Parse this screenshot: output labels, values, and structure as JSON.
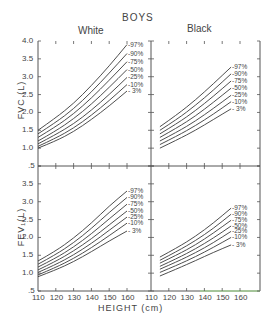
{
  "title": "BOYS",
  "groups": [
    "White",
    "Black"
  ],
  "xlabel": "HEIGHT (cm)",
  "colors": {
    "line": "#3a3a3a",
    "axis": "#555555",
    "accent_top": "#b070c0",
    "accent_green": "#9fe08a"
  },
  "chart_data": [
    {
      "type": "line",
      "title": "BOYS — White — FVC",
      "xlabel": "HEIGHT (cm)",
      "ylabel": "FVC (L)",
      "xlim": [
        110,
        170
      ],
      "ylim": [
        0.5,
        4.0
      ],
      "xticks": [
        110,
        120,
        130,
        140,
        150,
        160
      ],
      "yticks": [
        0.5,
        1.0,
        1.5,
        2.0,
        2.5,
        3.0,
        3.5,
        4.0
      ],
      "x": [
        110,
        120,
        130,
        140,
        150,
        160
      ],
      "series": [
        {
          "name": "97%",
          "values": [
            1.5,
            1.85,
            2.25,
            2.75,
            3.3,
            3.9
          ]
        },
        {
          "name": "90%",
          "values": [
            1.4,
            1.72,
            2.1,
            2.57,
            3.1,
            3.65
          ]
        },
        {
          "name": "75%",
          "values": [
            1.3,
            1.6,
            1.96,
            2.4,
            2.9,
            3.42
          ]
        },
        {
          "name": "50%",
          "values": [
            1.2,
            1.48,
            1.82,
            2.23,
            2.7,
            3.2
          ]
        },
        {
          "name": "25%",
          "values": [
            1.12,
            1.38,
            1.68,
            2.06,
            2.5,
            2.98
          ]
        },
        {
          "name": "10%",
          "values": [
            1.05,
            1.28,
            1.56,
            1.92,
            2.33,
            2.78
          ]
        },
        {
          "name": "3%",
          "values": [
            1.0,
            1.2,
            1.46,
            1.8,
            2.18,
            2.6
          ]
        }
      ]
    },
    {
      "type": "line",
      "title": "BOYS — Black — FVC",
      "xlabel": "HEIGHT (cm)",
      "ylabel": "FVC (L)",
      "xlim": [
        110,
        170
      ],
      "ylim": [
        0.5,
        4.0
      ],
      "xticks": [
        110,
        120,
        130,
        140,
        150,
        160
      ],
      "x": [
        115,
        125,
        135,
        145,
        155
      ],
      "series": [
        {
          "name": "97%",
          "values": [
            1.6,
            1.95,
            2.35,
            2.8,
            3.27
          ]
        },
        {
          "name": "90%",
          "values": [
            1.5,
            1.82,
            2.2,
            2.62,
            3.08
          ]
        },
        {
          "name": "75%",
          "values": [
            1.4,
            1.7,
            2.05,
            2.45,
            2.88
          ]
        },
        {
          "name": "50%",
          "values": [
            1.3,
            1.58,
            1.9,
            2.28,
            2.68
          ]
        },
        {
          "name": "25%",
          "values": [
            1.2,
            1.46,
            1.76,
            2.11,
            2.48
          ]
        },
        {
          "name": "10%",
          "values": [
            1.1,
            1.35,
            1.63,
            1.95,
            2.3
          ]
        },
        {
          "name": "3%",
          "values": [
            1.0,
            1.24,
            1.5,
            1.8,
            2.1
          ]
        }
      ]
    },
    {
      "type": "line",
      "title": "BOYS — White — FEV1",
      "xlabel": "HEIGHT (cm)",
      "ylabel": "FEV1 (L)",
      "xlim": [
        110,
        170
      ],
      "ylim": [
        0.5,
        4.0
      ],
      "xticks": [
        110,
        120,
        130,
        140,
        150,
        160
      ],
      "yticks": [
        0.5,
        1.0,
        1.5,
        2.0,
        2.5,
        3.0,
        3.5
      ],
      "x": [
        110,
        120,
        130,
        140,
        150,
        160
      ],
      "series": [
        {
          "name": "97%",
          "values": [
            1.34,
            1.62,
            1.98,
            2.4,
            2.88,
            3.3
          ]
        },
        {
          "name": "90%",
          "values": [
            1.25,
            1.52,
            1.85,
            2.25,
            2.7,
            3.12
          ]
        },
        {
          "name": "75%",
          "values": [
            1.17,
            1.42,
            1.73,
            2.1,
            2.52,
            2.93
          ]
        },
        {
          "name": "50%",
          "values": [
            1.09,
            1.33,
            1.62,
            1.96,
            2.35,
            2.74
          ]
        },
        {
          "name": "25%",
          "values": [
            1.02,
            1.24,
            1.51,
            1.83,
            2.2,
            2.57
          ]
        },
        {
          "name": "10%",
          "values": [
            0.95,
            1.16,
            1.41,
            1.71,
            2.05,
            2.4
          ]
        },
        {
          "name": "3%",
          "values": [
            0.9,
            1.09,
            1.32,
            1.6,
            1.9,
            2.18
          ]
        }
      ]
    },
    {
      "type": "line",
      "title": "BOYS — Black — FEV1",
      "xlabel": "HEIGHT (cm)",
      "ylabel": "FEV1 (L)",
      "xlim": [
        110,
        170
      ],
      "ylim": [
        0.5,
        4.0
      ],
      "xticks": [
        110,
        120,
        130,
        140,
        150,
        160
      ],
      "x": [
        115,
        125,
        135,
        145,
        155
      ],
      "series": [
        {
          "name": "97%",
          "values": [
            1.45,
            1.72,
            2.03,
            2.4,
            2.82
          ]
        },
        {
          "name": "90%",
          "values": [
            1.36,
            1.62,
            1.91,
            2.25,
            2.65
          ]
        },
        {
          "name": "75%",
          "values": [
            1.28,
            1.52,
            1.79,
            2.12,
            2.48
          ]
        },
        {
          "name": "50%",
          "values": [
            1.19,
            1.42,
            1.68,
            1.98,
            2.32
          ]
        },
        {
          "name": "25%",
          "values": [
            1.11,
            1.33,
            1.57,
            1.85,
            2.17
          ]
        },
        {
          "name": "10%",
          "values": [
            1.02,
            1.23,
            1.46,
            1.72,
            2.0
          ]
        },
        {
          "name": "3%",
          "values": [
            0.92,
            1.13,
            1.35,
            1.58,
            1.79
          ]
        }
      ]
    }
  ],
  "labels": {
    "fvc_ylabel": "FVC (L)",
    "fev_ylabel": "FEV₁(L)",
    "fvc_yticks": [
      "4.0",
      "3.5",
      "3.0",
      "2.5",
      "2.0",
      "1.5",
      "1.0",
      ".5"
    ],
    "fev_yticks": [
      "3.5",
      "3.0",
      "2.5",
      "2.0",
      "1.5",
      "1.0",
      ".5"
    ],
    "xticks": [
      "110",
      "120",
      "130",
      "140",
      "150",
      "160"
    ],
    "percentiles": [
      "-97%",
      "-90%",
      "-75%",
      "-50%",
      "-25%",
      "-10%",
      "- 3%"
    ]
  }
}
